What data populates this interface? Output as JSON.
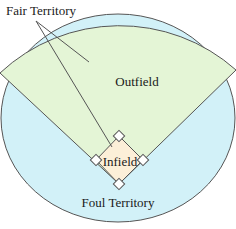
{
  "labels": {
    "fair_territory": "Fair Territory",
    "outfield": "Outfield",
    "infield": "Infield",
    "foul_territory": "Foul Territory"
  },
  "colors": {
    "fair": "#e4f5d6",
    "foul": "#d2f1f8",
    "infield": "#fcefd8",
    "line": "#555555",
    "background": "#ffffff"
  }
}
